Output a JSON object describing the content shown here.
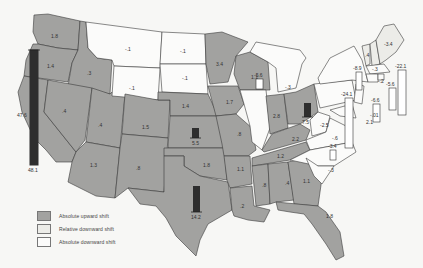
{
  "map": {
    "colors": {
      "absolute_upward": "#a2a2a0",
      "relative_downward": "#ecece8",
      "absolute_downward": "#fbfbfa",
      "bar_up": "#2e2e2e",
      "bar_down": "#ffffff",
      "background": "#f7f7f5"
    },
    "states": [
      {
        "id": "WA",
        "value": "1.8",
        "shift": "up"
      },
      {
        "id": "OR",
        "value": "1.4",
        "shift": "up"
      },
      {
        "id": "CA",
        "value": "47.6",
        "bar_value": "48.1",
        "shift": "up"
      },
      {
        "id": "ID",
        "value": ".3",
        "shift": "up"
      },
      {
        "id": "NV",
        "value": ".4",
        "shift": "up"
      },
      {
        "id": "UT",
        "value": ".4",
        "shift": "up"
      },
      {
        "id": "AZ",
        "value": "1.3",
        "shift": "up"
      },
      {
        "id": "MT",
        "value": "-.1",
        "shift": "abs_down"
      },
      {
        "id": "WY",
        "value": "-.1",
        "shift": "abs_down"
      },
      {
        "id": "CO",
        "value": "1.5",
        "shift": "up"
      },
      {
        "id": "NM",
        "value": ".8",
        "shift": "up"
      },
      {
        "id": "ND",
        "value": "-.1",
        "shift": "abs_down"
      },
      {
        "id": "SD",
        "value": "-.1",
        "shift": "abs_down"
      },
      {
        "id": "NE",
        "value": "1.4",
        "shift": "up"
      },
      {
        "id": "KS",
        "value": "5.5",
        "shift": "up"
      },
      {
        "id": "OK",
        "value": "1.8",
        "shift": "up"
      },
      {
        "id": "TX",
        "value": "14.2",
        "shift": "up"
      },
      {
        "id": "MN",
        "value": "3.4",
        "shift": "up"
      },
      {
        "id": "IA",
        "value": "1.7",
        "shift": "up"
      },
      {
        "id": "MO",
        "value": ".8",
        "shift": "up"
      },
      {
        "id": "AR",
        "value": "1.1",
        "shift": "up"
      },
      {
        "id": "LA",
        "value": ".2",
        "shift": "up"
      },
      {
        "id": "WI",
        "value": "1.1",
        "shift": "up"
      },
      {
        "id": "IL",
        "value": "-5.6",
        "shift": "abs_down"
      },
      {
        "id": "MI",
        "value": "-.3",
        "shift": "abs_down"
      },
      {
        "id": "IN",
        "value": "2.8",
        "shift": "up"
      },
      {
        "id": "OH",
        "value": "7.5",
        "shift": "up"
      },
      {
        "id": "KY",
        "value": "2.2",
        "shift": "up"
      },
      {
        "id": "TN",
        "value": "1.2",
        "shift": "up"
      },
      {
        "id": "MS",
        "value": ".8",
        "shift": "up"
      },
      {
        "id": "AL",
        "value": ".4",
        "shift": "up"
      },
      {
        "id": "GA",
        "value": "1.1",
        "shift": "up"
      },
      {
        "id": "FL",
        "value": "1.8",
        "shift": "up"
      },
      {
        "id": "WV",
        "value": "-2.5",
        "shift": "abs_down"
      },
      {
        "id": "VA",
        "value": "-.6",
        "shift": "abs_down"
      },
      {
        "id": "NC",
        "value": "-3.4",
        "shift": "abs_down"
      },
      {
        "id": "SC",
        "value": "-.3",
        "shift": "abs_down"
      },
      {
        "id": "PA",
        "value": "-24.1",
        "shift": "abs_down"
      },
      {
        "id": "NY",
        "value": "-8.9",
        "shift": "abs_down"
      },
      {
        "id": "NJ",
        "value": "-6.6",
        "shift": "abs_down"
      },
      {
        "id": "DE",
        "value": "-.01",
        "shift": "abs_down"
      },
      {
        "id": "MD",
        "value": "-2.1",
        "shift": "abs_down"
      },
      {
        "id": "VT",
        "value": "-.4",
        "shift": "rel_down"
      },
      {
        "id": "NH",
        "value": "-.3",
        "shift": "rel_down"
      },
      {
        "id": "ME",
        "value": "-3.4",
        "shift": "rel_down"
      },
      {
        "id": "MA",
        "value": "-22.1",
        "shift": "abs_down"
      },
      {
        "id": "CT",
        "value": "-5.6",
        "shift": "abs_down"
      },
      {
        "id": "RI",
        "value": "-.2",
        "shift": "abs_down"
      }
    ]
  },
  "labels": {
    "WA": "1.8",
    "OR": "1.4",
    "CA_side": "47.6",
    "CA_bar": "48.1",
    "ID": ".3",
    "NV": ".4",
    "UT": ".4",
    "AZ": "1.3",
    "MT": "-.1",
    "WY": "-.1",
    "CO": "1.5",
    "NM": ".8",
    "ND": "-.1",
    "SD": "-.1",
    "NE": "1.4",
    "KS": "5.5",
    "OK": "1.8",
    "TX": "14.2",
    "MN": "3.4",
    "IA": "1.7",
    "MO": ".8",
    "AR": "1.1",
    "LA": ".2",
    "WI": "1.1",
    "IL": "-5.6",
    "MI": "-.3",
    "IN": "2.8",
    "OH": "7.5",
    "KY": "2.2",
    "TN": "1.2",
    "MS": ".8",
    "AL": ".4",
    "GA": "1.1",
    "FL": "1.8",
    "WV": "-2.5",
    "VA": "-.6",
    "NC": "-3.4",
    "SC": "-.3",
    "PA": "-24.1",
    "NY": "-8.9",
    "NJ": "-6.6",
    "DE": "-.01",
    "MD": "2.1",
    "VT": ".4",
    "NH": "-.3",
    "ME": "-3.4",
    "MA": "-22.1",
    "CT": "-5.6",
    "RI": "-.2"
  },
  "legend": {
    "items": [
      {
        "label": "Absolute upward shift",
        "color": "#a2a2a0"
      },
      {
        "label": "Relative downward shift",
        "color": "#ecece8"
      },
      {
        "label": "Absolute downward shift",
        "color": "#fbfbfa"
      }
    ]
  }
}
